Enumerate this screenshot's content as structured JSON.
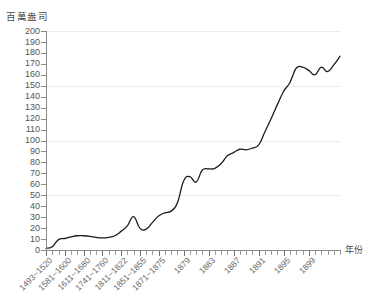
{
  "chart_data": {
    "type": "line",
    "title": "",
    "subtitle": "",
    "ylabel": "百萬盎司",
    "xlabel": "年份",
    "ylim": [
      0,
      200
    ],
    "ytick_step": 10,
    "grid": "horizontal major gridlines at 50, 100, 150, 200",
    "legend": "none",
    "y_ticks": [
      200,
      190,
      180,
      170,
      160,
      150,
      140,
      130,
      120,
      110,
      100,
      90,
      80,
      70,
      60,
      50,
      40,
      30,
      20,
      10,
      0
    ],
    "gridline_values": [
      200,
      150,
      100,
      50
    ],
    "x_tick_labels": [
      "1493~1520",
      "1581~1600",
      "1611~1680",
      "1741~1760",
      "1811~1822",
      "1851~1855",
      "1871~1875",
      "1879",
      "1883",
      "1887",
      "1891",
      "1895",
      "1899"
    ],
    "x_label_positions": [
      0,
      3,
      6,
      9,
      12,
      15,
      18,
      22,
      26,
      30,
      34,
      38,
      42
    ],
    "n_points": 45,
    "categories": [
      "1493~1520",
      "1521~1544",
      "1545~1560",
      "1561~1580",
      "1581~1600",
      "1601~1610",
      "1611~1680",
      "1681~1700",
      "1701~1720",
      "1721~1740",
      "1741~1760",
      "1761~1780",
      "1781~1800",
      "1801~1810",
      "1811~1822",
      "1823~1830",
      "1831~1840",
      "1841~1850",
      "1851~1855",
      "1856~1860",
      "1861~1865",
      "1866~1870",
      "1871~1875",
      "1876",
      "1877",
      "1878",
      "1879",
      "1880",
      "1881",
      "1882",
      "1883",
      "1884",
      "1885",
      "1886",
      "1887",
      "1888",
      "1889",
      "1890",
      "1891",
      "1892",
      "1893",
      "1894",
      "1895",
      "1896",
      "1897",
      "1898",
      "1899",
      "1900"
    ],
    "values": [
      1.5,
      3.0,
      9.5,
      10.5,
      12.0,
      13.0,
      13.0,
      12.5,
      11.5,
      11.0,
      11.5,
      13.0,
      17.0,
      22.0,
      30.5,
      20.0,
      19.0,
      25.0,
      31.0,
      34.0,
      35.5,
      43.0,
      63.0,
      67.0,
      62.0,
      73.0,
      74.0,
      74.5,
      79.0,
      86.0,
      89.0,
      92.0,
      91.5,
      93.0,
      96.0,
      108.0,
      120.0,
      133.0,
      145.0,
      153.0,
      166.0,
      167.0,
      164.0,
      160.0,
      167.0,
      163.0,
      169.0,
      177.0
    ],
    "series": [
      {
        "name": "世界白銀產量",
        "values": [
          1.5,
          3.0,
          9.5,
          10.5,
          12.0,
          13.0,
          13.0,
          12.5,
          11.5,
          11.0,
          11.5,
          13.0,
          17.0,
          22.0,
          30.5,
          20.0,
          19.0,
          25.0,
          31.0,
          34.0,
          35.5,
          43.0,
          63.0,
          67.0,
          62.0,
          73.0,
          74.0,
          74.5,
          79.0,
          86.0,
          89.0,
          92.0,
          91.5,
          93.0,
          96.0,
          108.0,
          120.0,
          133.0,
          145.0,
          153.0,
          166.0,
          167.0,
          164.0,
          160.0,
          167.0,
          163.0,
          169.0,
          177.0
        ]
      }
    ],
    "line_color": "#1c1c1c",
    "grid_color": "#ececec",
    "axis_color": "#8a8a8a"
  }
}
